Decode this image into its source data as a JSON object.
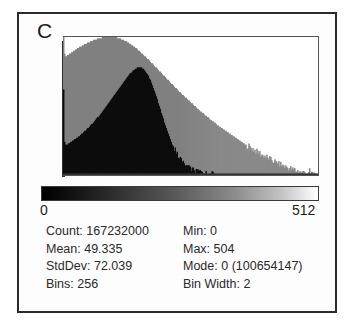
{
  "panel": {
    "letter": "C"
  },
  "axis": {
    "min_label": "0",
    "max_label": "512"
  },
  "stats": {
    "left": [
      {
        "label": "Count:",
        "value": "167232000",
        "text": "Count: 167232000"
      },
      {
        "label": "Mean:",
        "value": "49.335",
        "text": "Mean: 49.335"
      },
      {
        "label": "StdDev:",
        "value": "72.039",
        "text": "StdDev: 72.039"
      },
      {
        "label": "Bins:",
        "value": "256",
        "text": "Bins: 256"
      }
    ],
    "right": [
      {
        "label": "Min:",
        "value": "0",
        "text": "Min: 0"
      },
      {
        "label": "Max:",
        "value": "504",
        "text": "Max: 504"
      },
      {
        "label": "Mode:",
        "value": "0 (100654147)",
        "text": "Mode: 0 (100654147)"
      },
      {
        "label": "Bin Width:",
        "value": "2",
        "text": "Bin Width: 2"
      }
    ]
  },
  "colors": {
    "series_gray": "#808080",
    "series_black": "#0d0d0d",
    "frame": "#2b2b2b",
    "axis": "#2f2f2f",
    "text": "#2a2a2a",
    "background": "#ffffff"
  },
  "chart_data": {
    "type": "bar",
    "title": "C",
    "xlabel": "",
    "ylabel": "",
    "xlim": [
      0,
      512
    ],
    "ylim": [
      0,
      100654147
    ],
    "grid": false,
    "legend": "none",
    "bins": 256,
    "bin_width": 2,
    "tick_labels": [
      "0",
      "512"
    ],
    "annotations": [
      "Count: 167232000",
      "Mean: 49.335",
      "StdDev: 72.039",
      "Bins: 256",
      "Min: 0",
      "Max: 504",
      "Mode: 0 (100654147)",
      "Bin Width: 2"
    ],
    "lut_ramp": {
      "from": "#000000",
      "to": "#ffffff"
    },
    "x": [
      0,
      2,
      4,
      6,
      8,
      10,
      12,
      14,
      16,
      18,
      20,
      22,
      24,
      26,
      28,
      30,
      32,
      34,
      36,
      38,
      40,
      42,
      44,
      46,
      48,
      50,
      52,
      54,
      56,
      58,
      60,
      62,
      64,
      66,
      68,
      70,
      72,
      74,
      76,
      78,
      80,
      82,
      84,
      86,
      88,
      90,
      92,
      94,
      96,
      98,
      100,
      102,
      104,
      106,
      108,
      110,
      112,
      114,
      116,
      118,
      120,
      122,
      124,
      126,
      128,
      130,
      132,
      134,
      136,
      138,
      140,
      142,
      144,
      146,
      148,
      150,
      152,
      154,
      156,
      158,
      160,
      162,
      164,
      166,
      168,
      170,
      172,
      174,
      176,
      178,
      180,
      182,
      184,
      186,
      188,
      190,
      192,
      194,
      196,
      198,
      200,
      202,
      204,
      206,
      208,
      210,
      212,
      214,
      216,
      218,
      220,
      222,
      224,
      226,
      228,
      230,
      232,
      234,
      236,
      238,
      240,
      242,
      244,
      246,
      248,
      250,
      252,
      254,
      256,
      258,
      260,
      262,
      264,
      266,
      268,
      270,
      272,
      274,
      276,
      278,
      280,
      282,
      284,
      286,
      288,
      290,
      292,
      294,
      296,
      298,
      300,
      302,
      304,
      306,
      308,
      310,
      312,
      314,
      316,
      318,
      320,
      322,
      324,
      326,
      328,
      330,
      332,
      334,
      336,
      338,
      340,
      342,
      344,
      346,
      348,
      350,
      352,
      354,
      356,
      358,
      360,
      362,
      364,
      366,
      368,
      370,
      372,
      374,
      376,
      378,
      380,
      382,
      384,
      386,
      388,
      390,
      392,
      394,
      396,
      398,
      400,
      402,
      404,
      406,
      408,
      410,
      412,
      414,
      416,
      418,
      420,
      422,
      424,
      426,
      428,
      430,
      432,
      434,
      436,
      438,
      440,
      442,
      444,
      446,
      448,
      450,
      452,
      454,
      456,
      458,
      460,
      462,
      464,
      466,
      468,
      470,
      472,
      474,
      476,
      478,
      480,
      482,
      484,
      486,
      488,
      490,
      492,
      494,
      496,
      498,
      500,
      502,
      504,
      506,
      508,
      510
    ],
    "series": [
      {
        "name": "gray-distribution",
        "color": "#808080",
        "values": [
          100,
          88,
          86,
          86,
          87,
          87,
          88,
          88,
          89,
          89,
          90,
          90,
          91,
          91,
          92,
          92,
          93,
          93,
          93,
          94,
          94,
          95,
          95,
          95,
          96,
          96,
          96,
          97,
          97,
          97,
          98,
          98,
          98,
          98,
          99,
          99,
          99,
          99,
          99,
          100,
          100,
          100,
          100,
          100,
          100,
          100,
          100,
          100,
          100,
          100,
          100,
          100,
          100,
          100,
          99,
          99,
          99,
          99,
          98,
          98,
          98,
          97,
          97,
          97,
          96,
          96,
          95,
          95,
          94,
          94,
          93,
          93,
          92,
          92,
          91,
          90,
          90,
          89,
          88,
          88,
          87,
          86,
          86,
          85,
          84,
          84,
          83,
          82,
          81,
          81,
          80,
          79,
          78,
          78,
          77,
          76,
          75,
          75,
          74,
          73,
          72,
          72,
          71,
          70,
          69,
          69,
          68,
          67,
          66,
          66,
          65,
          64,
          63,
          63,
          62,
          61,
          60,
          60,
          59,
          58,
          58,
          57,
          56,
          56,
          55,
          54,
          54,
          53,
          52,
          52,
          51,
          50,
          50,
          49,
          48,
          48,
          47,
          46,
          46,
          45,
          45,
          44,
          43,
          43,
          42,
          42,
          41,
          40,
          40,
          39,
          39,
          38,
          38,
          37,
          36,
          36,
          35,
          35,
          34,
          34,
          33,
          33,
          32,
          32,
          31,
          31,
          30,
          30,
          29,
          29,
          28,
          28,
          27,
          27,
          26,
          26,
          25,
          25,
          24,
          24,
          23,
          23,
          22,
          22,
          21,
          21,
          21,
          20,
          20,
          19,
          19,
          18,
          18,
          17,
          17,
          17,
          16,
          16,
          15,
          15,
          14,
          14,
          14,
          13,
          13,
          12,
          12,
          12,
          11,
          11,
          10,
          10,
          10,
          9,
          9,
          9,
          8,
          8,
          8,
          7,
          7,
          7,
          6,
          6,
          6,
          5,
          5,
          5,
          5,
          4,
          4,
          4,
          4,
          3,
          3,
          3,
          3,
          3,
          2,
          2,
          2,
          2,
          2,
          2,
          1,
          2,
          1,
          3,
          1,
          2,
          1,
          1,
          1,
          0,
          0,
          0
        ]
      },
      {
        "name": "black-distribution",
        "color": "#0d0d0d",
        "values": [
          62,
          24,
          22,
          22,
          22,
          23,
          23,
          24,
          24,
          25,
          25,
          26,
          26,
          27,
          27,
          28,
          28,
          29,
          30,
          30,
          31,
          32,
          32,
          33,
          34,
          34,
          35,
          36,
          37,
          37,
          38,
          39,
          40,
          41,
          42,
          42,
          43,
          44,
          45,
          46,
          47,
          48,
          49,
          50,
          51,
          52,
          53,
          54,
          55,
          56,
          57,
          58,
          59,
          60,
          61,
          62,
          63,
          64,
          65,
          66,
          67,
          68,
          69,
          70,
          71,
          72,
          73,
          74,
          74,
          75,
          76,
          76,
          77,
          77,
          78,
          78,
          78,
          78,
          78,
          77,
          77,
          76,
          75,
          74,
          73,
          72,
          70,
          69,
          67,
          65,
          63,
          61,
          59,
          57,
          55,
          52,
          50,
          48,
          45,
          43,
          41,
          38,
          36,
          34,
          32,
          30,
          28,
          26,
          24,
          22,
          21,
          19,
          18,
          16,
          15,
          14,
          13,
          12,
          11,
          10,
          9,
          8,
          8,
          7,
          6,
          6,
          5,
          5,
          4,
          4,
          4,
          3,
          3,
          3,
          2,
          2,
          2,
          2,
          2,
          2,
          1,
          1,
          1,
          1,
          1,
          1,
          1,
          1,
          1,
          1,
          1,
          1,
          0,
          0,
          0,
          0,
          0,
          0,
          0,
          0,
          0,
          0,
          0,
          0,
          0,
          0,
          0,
          0,
          0,
          0,
          0,
          0,
          0,
          0,
          0,
          0,
          0,
          0,
          0,
          0,
          0,
          0,
          0,
          0,
          0,
          0,
          0,
          0,
          0,
          0,
          0,
          0,
          0,
          0,
          0,
          0,
          0,
          0,
          0,
          0,
          0,
          0,
          0,
          0,
          0,
          0,
          0,
          0,
          0,
          0,
          0,
          0,
          0,
          0,
          0,
          0,
          0,
          0,
          0,
          0,
          0,
          0,
          0,
          0,
          0,
          0,
          0,
          0,
          0,
          0,
          0,
          0,
          0,
          0,
          0,
          0,
          0,
          0,
          0,
          0,
          0,
          0,
          0,
          0,
          0,
          0,
          0,
          0,
          0,
          0,
          0,
          0,
          0,
          0,
          0,
          0
        ]
      }
    ]
  }
}
